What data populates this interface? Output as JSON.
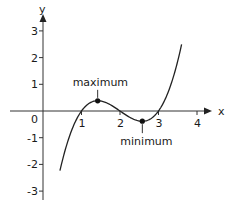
{
  "chart_data": {
    "type": "line",
    "title": "",
    "xlabel": "x",
    "ylabel": "y",
    "xlim": [
      -0.9,
      4.3
    ],
    "ylim": [
      -3.3,
      3.4
    ],
    "x_ticks": [
      1,
      2,
      3,
      4
    ],
    "y_ticks": [
      3,
      2,
      1,
      -1,
      -2,
      -3
    ],
    "origin_label": "0",
    "grid": false,
    "function": "y = (x-1)(x-2)(x-3)",
    "series": [
      {
        "name": "cubic",
        "x": [
          0.44,
          0.6,
          0.8,
          1.0,
          1.2,
          1.42,
          1.6,
          1.8,
          2.0,
          2.2,
          2.4,
          2.58,
          2.8,
          3.0,
          3.2,
          3.4,
          3.6
        ],
        "values": [
          -2.24,
          -1.34,
          -0.53,
          0.0,
          0.29,
          0.38,
          0.34,
          0.19,
          0.0,
          -0.19,
          -0.34,
          -0.38,
          -0.29,
          0.0,
          0.53,
          1.34,
          2.5
        ]
      }
    ],
    "annotations": [
      {
        "label": "maximum",
        "x": 1.42,
        "y": 0.38
      },
      {
        "label": "minimum",
        "x": 2.58,
        "y": -0.38
      }
    ]
  }
}
